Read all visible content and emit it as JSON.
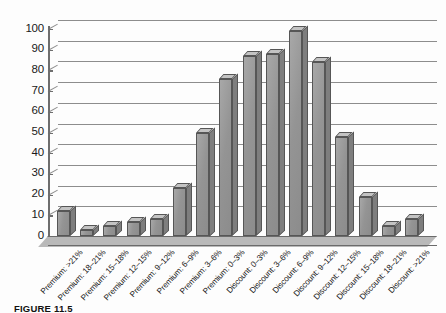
{
  "figure": {
    "caption": "FIGURE 11.5",
    "background_color": "#fdfdfd",
    "bar_fill_color": "#9c9c9c",
    "bar_edge_color": "#565656",
    "grid_color": "#8d8d8d",
    "axis_color": "#6e6e6e"
  },
  "chart_data": {
    "type": "bar",
    "title": "",
    "subtitle": "",
    "xlabel": "",
    "ylabel": "",
    "ylim": [
      0,
      100
    ],
    "yticks": [
      0,
      10,
      20,
      30,
      40,
      50,
      60,
      70,
      80,
      90,
      100
    ],
    "ytick_labels": [
      "0",
      "10",
      "20",
      "30",
      "40",
      "50",
      "60",
      "70",
      "80",
      "90",
      "100"
    ],
    "grid": true,
    "grid_axis": "y",
    "legend": false,
    "legend_position": "none",
    "three_d": true,
    "orientation": "vertical",
    "categories": [
      "Premium: >21%",
      "Premium: 18–21%",
      "Premium: 15–18%",
      "Premium: 12–15%",
      "Premium: 9–12%",
      "Premium: 6–9%",
      "Premium: 3–6%",
      "Premium: 0–3%",
      "Discount: 0–3%",
      "Discount: 3–6%",
      "Discount: 6–9%",
      "Discount: 9–12%",
      "Discount: 12–15%",
      "Discount: 15–18%",
      "Discount: 18–21%",
      "Discount: >21%"
    ],
    "values": [
      12,
      3,
      5,
      7,
      8,
      23,
      50,
      76,
      87,
      88,
      99,
      84,
      48,
      19,
      5,
      8
    ],
    "series": [
      {
        "name": "Frequency",
        "values": [
          12,
          3,
          5,
          7,
          8,
          23,
          50,
          76,
          87,
          88,
          99,
          84,
          48,
          19,
          5,
          8
        ]
      }
    ]
  }
}
